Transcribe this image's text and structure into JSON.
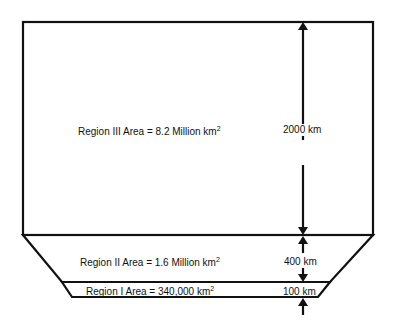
{
  "diagram": {
    "regions": [
      {
        "id": "region-3",
        "label": "Region III Area = 8.2 Million km",
        "sup": "2",
        "thickness": "2000 km"
      },
      {
        "id": "region-2",
        "label": "Region II Area = 1.6 Million km",
        "sup": "2",
        "thickness": "400 km"
      },
      {
        "id": "region-1",
        "label": "Region I Area = 340,000 km",
        "sup": "2",
        "thickness": "100 km"
      }
    ],
    "line_color": "#111111",
    "background": "#ffffff"
  }
}
